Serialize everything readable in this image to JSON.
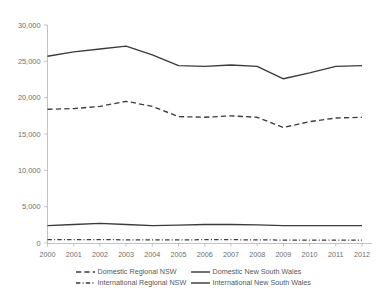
{
  "chart_data": {
    "type": "line",
    "title": "",
    "subtitle": "",
    "xlabel": "",
    "ylabel": "",
    "grid": false,
    "legend_position": "bottom",
    "categories": [
      "2000",
      "2001",
      "2002",
      "2003",
      "2004",
      "2005",
      "2006",
      "2007",
      "2008",
      "2009",
      "2010",
      "2011",
      "2012"
    ],
    "x": [
      2000,
      2001,
      2002,
      2003,
      2004,
      2005,
      2006,
      2007,
      2008,
      2009,
      2010,
      2011,
      2012
    ],
    "xlim": [
      2000,
      2012
    ],
    "ylim": [
      0,
      30000
    ],
    "ytick_labels": [
      "0",
      "5,000",
      "10,000",
      "15,000",
      "20,000",
      "25,000",
      "30,000"
    ],
    "ytick_values": [
      0,
      5000,
      10000,
      15000,
      20000,
      25000,
      30000
    ],
    "series": [
      {
        "name": "Domestic New South Wales",
        "style": "solid",
        "color": "#3b3b3b",
        "values": [
          25700,
          26300,
          26700,
          27100,
          25900,
          24400,
          24300,
          24500,
          24300,
          22600,
          23400,
          24300,
          24400
        ]
      },
      {
        "name": "Domestic Regional NSW",
        "style": "dashed",
        "color": "#3b3b3b",
        "values": [
          18400,
          18500,
          18800,
          19500,
          18800,
          17400,
          17300,
          17500,
          17300,
          15900,
          16700,
          17200,
          17300
        ]
      },
      {
        "name": "International New South Wales",
        "style": "solid",
        "color": "#3b3b3b",
        "values": [
          2400,
          2550,
          2700,
          2550,
          2400,
          2450,
          2550,
          2550,
          2500,
          2400,
          2400,
          2400,
          2400
        ]
      },
      {
        "name": "International Regional NSW",
        "style": "dashdot",
        "color": "#3b3b3b",
        "values": [
          480,
          470,
          460,
          440,
          430,
          440,
          450,
          450,
          440,
          400,
          400,
          400,
          400
        ]
      }
    ],
    "legend": [
      {
        "label": "Domestic Regional NSW",
        "style": "dashed",
        "column": 0,
        "row": 0
      },
      {
        "label": "Domestic New South Wales",
        "style": "solid",
        "column": 1,
        "row": 0
      },
      {
        "label": "International Regional NSW",
        "style": "dashdot",
        "column": 0,
        "row": 1
      },
      {
        "label": "International New South Wales",
        "style": "solid",
        "column": 1,
        "row": 1
      }
    ]
  }
}
